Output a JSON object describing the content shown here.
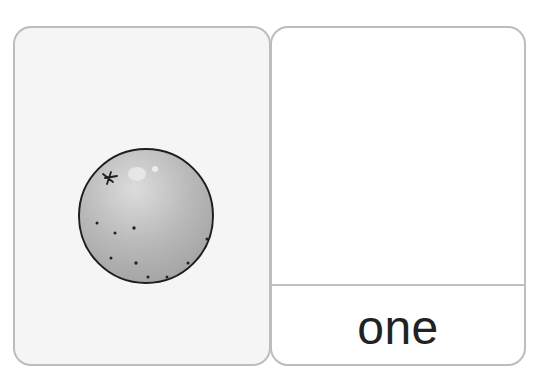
{
  "flashcard": {
    "picture_card": {
      "illustration": "orange-fruit-icon",
      "count": 1,
      "background": "#f5f5f5"
    },
    "word_card": {
      "word": "one",
      "text_color": "#222222"
    },
    "border_color": "#bdbdbd"
  }
}
